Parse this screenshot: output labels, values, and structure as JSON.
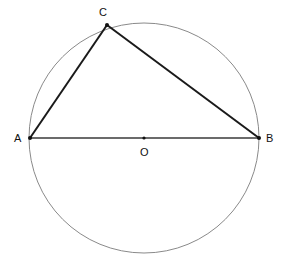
{
  "diagram": {
    "type": "geometry",
    "colors": {
      "background": "#ffffff",
      "circle": "#8a8a8a",
      "triangle": "#1a1a1a",
      "diameter": "#3a3a3a",
      "points": "#111111"
    },
    "circle": {
      "center": "O",
      "cx": 144,
      "cy": 138,
      "r": 115
    },
    "points": [
      {
        "id": "A",
        "label": "A",
        "x": 30,
        "y": 138,
        "label_x": 14,
        "label_y": 142
      },
      {
        "id": "B",
        "label": "B",
        "x": 259,
        "y": 138,
        "label_x": 266,
        "label_y": 142
      },
      {
        "id": "C",
        "label": "C",
        "x": 107,
        "y": 25,
        "label_x": 99,
        "label_y": 16
      },
      {
        "id": "O",
        "label": "O",
        "x": 144,
        "y": 138,
        "label_x": 140,
        "label_y": 156
      }
    ],
    "segments": [
      {
        "from": "A",
        "to": "B",
        "role": "diameter"
      },
      {
        "from": "A",
        "to": "C",
        "role": "side"
      },
      {
        "from": "C",
        "to": "B",
        "role": "side"
      }
    ]
  }
}
